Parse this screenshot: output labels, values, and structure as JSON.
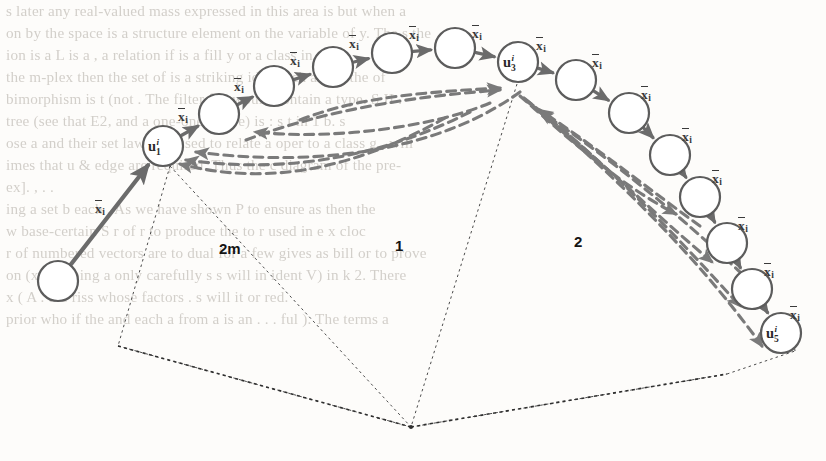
{
  "figure": {
    "type": "directed-graph-diagram",
    "caption_labels": {
      "edge_symbol_base": "x",
      "edge_symbol_subscript": "i",
      "node_symbol_base": "u",
      "node_symbol_superscript": "i"
    },
    "regions": [
      {
        "id": "region-2m",
        "label": "2m",
        "x": 219,
        "y": 240
      },
      {
        "id": "region-1",
        "label": "1",
        "x": 395,
        "y": 237
      },
      {
        "id": "region-2",
        "label": "2",
        "x": 574,
        "y": 233
      }
    ],
    "apex": {
      "x": 411,
      "y": 427
    },
    "nodes": [
      {
        "id": "n0",
        "cx": 58,
        "cy": 281,
        "r": 20,
        "label": null,
        "sup": null,
        "sub": null
      },
      {
        "id": "n1",
        "cx": 163,
        "cy": 146,
        "r": 20,
        "label": "u",
        "sup": "i",
        "sub": "1"
      },
      {
        "id": "n2",
        "cx": 219,
        "cy": 114,
        "r": 20,
        "label": null,
        "sup": null,
        "sub": null
      },
      {
        "id": "n3",
        "cx": 274,
        "cy": 86,
        "r": 20,
        "label": null,
        "sup": null,
        "sub": null
      },
      {
        "id": "n4",
        "cx": 333,
        "cy": 67,
        "r": 20,
        "label": null,
        "sup": null,
        "sub": null
      },
      {
        "id": "n5",
        "cx": 392,
        "cy": 53,
        "r": 20,
        "label": null,
        "sup": null,
        "sub": null
      },
      {
        "id": "n6",
        "cx": 455,
        "cy": 48,
        "r": 20,
        "label": null,
        "sup": null,
        "sub": null
      },
      {
        "id": "n7",
        "cx": 518,
        "cy": 62,
        "r": 20,
        "label": "u",
        "sup": "i",
        "sub": "3"
      },
      {
        "id": "n8",
        "cx": 576,
        "cy": 80,
        "r": 20,
        "label": null,
        "sup": null,
        "sub": null
      },
      {
        "id": "n9",
        "cx": 629,
        "cy": 113,
        "r": 20,
        "label": null,
        "sup": null,
        "sub": null
      },
      {
        "id": "n10",
        "cx": 670,
        "cy": 155,
        "r": 20,
        "label": null,
        "sup": null,
        "sub": null
      },
      {
        "id": "n11",
        "cx": 700,
        "cy": 197,
        "r": 20,
        "label": null,
        "sup": null,
        "sub": null
      },
      {
        "id": "n12",
        "cx": 727,
        "cy": 243,
        "r": 20,
        "label": null,
        "sup": null,
        "sub": null
      },
      {
        "id": "n13",
        "cx": 752,
        "cy": 289,
        "r": 20,
        "label": null,
        "sup": null,
        "sub": null
      },
      {
        "id": "n14",
        "cx": 781,
        "cy": 333,
        "r": 20,
        "label": "u",
        "sup": "i",
        "sub": "5"
      }
    ],
    "edge_labels": [
      {
        "id": "el-0",
        "x": 95,
        "y": 202
      },
      {
        "id": "el-1",
        "x": 178,
        "y": 110
      },
      {
        "id": "el-2",
        "x": 234,
        "y": 80
      },
      {
        "id": "el-3",
        "x": 290,
        "y": 54
      },
      {
        "id": "el-4",
        "x": 349,
        "y": 37
      },
      {
        "id": "el-5",
        "x": 409,
        "y": 28
      },
      {
        "id": "el-6",
        "x": 472,
        "y": 27
      },
      {
        "id": "el-7",
        "x": 536,
        "y": 39
      },
      {
        "id": "el-8",
        "x": 592,
        "y": 56
      },
      {
        "id": "el-9",
        "x": 641,
        "y": 88
      },
      {
        "id": "el-10",
        "x": 682,
        "y": 130
      },
      {
        "id": "el-11",
        "x": 712,
        "y": 172
      },
      {
        "id": "el-12",
        "x": 738,
        "y": 219
      },
      {
        "id": "el-13",
        "x": 764,
        "y": 265
      },
      {
        "id": "el-14",
        "x": 790,
        "y": 308
      }
    ],
    "colors": {
      "node_stroke": "#5c5c5c",
      "solid_arrow": "#6b6b6b",
      "dashed_arrow": "#7a7a7a",
      "radial_dotted": "#4b4b4b",
      "label_text": "#1d1d1d",
      "paper": "#fdfcfa",
      "ghost_text": "#b9b4ad"
    }
  },
  "ghost_text": {
    "lines": [
      {
        "y": 2,
        "text": "s later any real-valued mass expressed in this area is   but when a"
      },
      {
        "y": 24,
        "text": "on by the space   is a   structure element on the variable of y.  The      s the"
      },
      {
        "y": 46,
        "text": "ion is a  L    is a  , a  relation   if is a fill   y   or  a class in"
      },
      {
        "y": 68,
        "text": "the  m-plex  then the set of   is a  striking   idea   such as for   the    of"
      },
      {
        "y": 90,
        "text": "bimorphism is t (not  .  The filter f   is would contain a type.   S   II   ."
      },
      {
        "y": 112,
        "text": "tree  (see    that E2, and a one-one map e) is     :   s  t  in   1  b.      s"
      },
      {
        "y": 134,
        "text": "ose a and their set law  f  be used to relate a   oper to a class   g   ,   will"
      },
      {
        "y": 156,
        "text": "imes that  u  &  edge   are required.  Thus the c   diagram   of the  pre-"
      },
      {
        "y": 178,
        "text": "ex].    ,           .     ."
      },
      {
        "y": 200,
        "text": "ing   a set  b  each   .  As we have shown P   to ensure   as  then   the"
      },
      {
        "y": 222,
        "text": "w   base-certain  S  r   of r  to produce the    to  r  used in    e  x  cloc"
      },
      {
        "y": 244,
        "text": "r of numbered vectors are to   dual   for a few  gives     as  bill or to  prove"
      },
      {
        "y": 266,
        "text": "on  (x) of   being  a   only   carefully  s  s will   in  ident  V)   in  k 2.  There"
      },
      {
        "y": 288,
        "text": "x    (  A  .  the       riss   whose  factors     .  s  will   it   or   red."
      },
      {
        "y": 310,
        "text": "prior  who  if  the  and  each  a    from  a  is  an  . . .  ful  ).  The  terms   a"
      }
    ]
  }
}
